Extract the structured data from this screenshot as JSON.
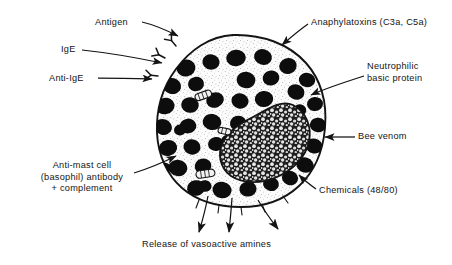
{
  "figure": {
    "background_color": "#ffffff",
    "ink_color": "#141414"
  },
  "labels": {
    "antigen": "Antigen",
    "ige": "IgE",
    "anti_ige": "Anti-IgE",
    "anaphylatoxins": "Anaphylatoxins (C3a, C5a)",
    "neutrophilic_line1": "Neutrophilic",
    "neutrophilic_line2": "basic protein",
    "bee_venom": "Bee venom",
    "chemicals": "Chemicals (48/80)",
    "antimast_line1": "Anti-mast cell",
    "antimast_line2": "(basophil) antibody",
    "antimast_line3": "+ complement",
    "release": "Release of vasoactive amines"
  },
  "cell": {
    "name": "mast-cell",
    "membrane_color": "#141414",
    "cytoplasm_color": "#fbfbfb",
    "granule_color": "#0d0d0d",
    "nucleus_outline_color": "#141414",
    "nucleus_fill_color": "#2a2a2a",
    "granule_count": 44,
    "mitochondria_count": 3,
    "receptor_count": 3
  },
  "arrows": {
    "incoming_count": 6,
    "outgoing_count": 3,
    "stroke_color": "#141414"
  }
}
